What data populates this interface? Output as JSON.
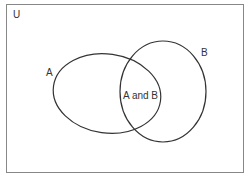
{
  "diagram": {
    "type": "venn",
    "universe_label": "U",
    "sets": [
      {
        "name": "A",
        "label": "A"
      },
      {
        "name": "B",
        "label": "B"
      }
    ],
    "intersection_label": "A and B",
    "colors": {
      "stroke": "#333333",
      "frame": "#888888",
      "background": "#ffffff",
      "text": "#333333"
    }
  }
}
